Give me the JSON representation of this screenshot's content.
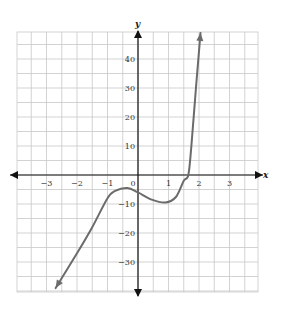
{
  "chart_data": {
    "type": "line",
    "title": "",
    "xlabel": "x",
    "ylabel": "y",
    "xlim": [
      -4,
      4
    ],
    "ylim": [
      -40,
      50
    ],
    "grid": true,
    "grid_step_x": 0.5,
    "grid_step_y": 5,
    "x_ticks": [
      -3,
      -2,
      -1,
      0,
      1,
      2,
      3
    ],
    "x_tick_labels": [
      "−3",
      "−2",
      "−1",
      "0",
      "1",
      "2",
      "3"
    ],
    "y_ticks": [
      -30,
      -20,
      -10,
      10,
      20,
      30,
      40
    ],
    "y_tick_labels": [
      "−30",
      "−20",
      "−10",
      "10",
      "20",
      "30",
      "40"
    ],
    "legend": null,
    "series": [
      {
        "name": "f(x)",
        "color": "#6b6b6b",
        "arrows_at_both_ends": true,
        "points": [
          {
            "x": -2.7,
            "y": -39
          },
          {
            "x": -2.0,
            "y": -27
          },
          {
            "x": -1.5,
            "y": -18
          },
          {
            "x": -1.0,
            "y": -8
          },
          {
            "x": -0.75,
            "y": -5.5
          },
          {
            "x": -0.35,
            "y": -4.5
          },
          {
            "x": 0.0,
            "y": -6
          },
          {
            "x": 0.45,
            "y": -8.5
          },
          {
            "x": 0.9,
            "y": -9.5
          },
          {
            "x": 1.25,
            "y": -7.5
          },
          {
            "x": 1.5,
            "y": -2
          },
          {
            "x": 1.65,
            "y": 0
          },
          {
            "x": 1.75,
            "y": 10
          },
          {
            "x": 1.9,
            "y": 30
          },
          {
            "x": 2.05,
            "y": 49
          }
        ]
      }
    ],
    "features": {
      "local_max": {
        "x": -0.35,
        "y": -4.5
      },
      "local_min": {
        "x": 0.9,
        "y": -9.5
      },
      "y_intercept": -6,
      "x_intercept": 1.65
    }
  }
}
